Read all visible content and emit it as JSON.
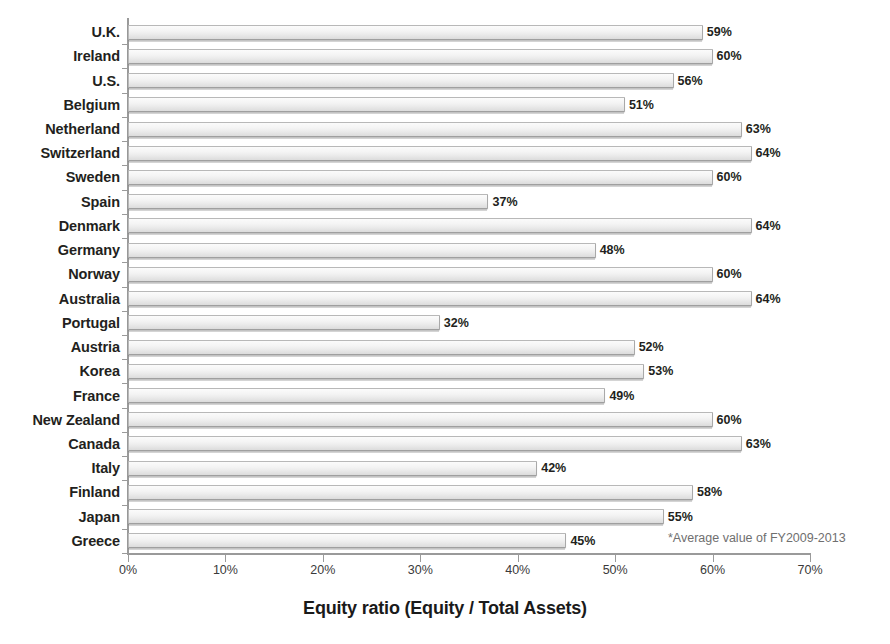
{
  "chart_data": {
    "type": "bar",
    "orientation": "horizontal",
    "title": "",
    "xlabel": "Equity ratio (Equity / Total Assets)",
    "ylabel": "",
    "xlim": [
      0,
      70
    ],
    "xticks": [
      "0%",
      "10%",
      "20%",
      "30%",
      "40%",
      "50%",
      "60%",
      "70%"
    ],
    "xtick_values": [
      0,
      10,
      20,
      30,
      40,
      50,
      60,
      70
    ],
    "grid": false,
    "legend": "none",
    "annotation": "*Average value of FY2009-2013",
    "value_suffix": "%",
    "categories": [
      "U.K.",
      "Ireland",
      "U.S.",
      "Belgium",
      "Netherland",
      "Switzerland",
      "Sweden",
      "Spain",
      "Denmark",
      "Germany",
      "Norway",
      "Australia",
      "Portugal",
      "Austria",
      "Korea",
      "France",
      "New Zealand",
      "Canada",
      "Italy",
      "Finland",
      "Japan",
      "Greece"
    ],
    "values": [
      59,
      60,
      56,
      51,
      63,
      64,
      60,
      37,
      64,
      48,
      60,
      64,
      32,
      52,
      53,
      49,
      60,
      63,
      42,
      58,
      55,
      45
    ],
    "value_labels": [
      "59%",
      "60%",
      "56%",
      "51%",
      "63%",
      "64%",
      "60%",
      "37%",
      "64%",
      "48%",
      "60%",
      "64%",
      "32%",
      "52%",
      "53%",
      "49%",
      "60%",
      "63%",
      "42%",
      "58%",
      "55%",
      "45%"
    ]
  },
  "style": {
    "bar_fill": "#f2f2f2",
    "bar_border": "#b8b8b8",
    "text_color": "#231f20",
    "footnote_color": "#6f6f6f",
    "axis_color": "#9a9a9a"
  }
}
